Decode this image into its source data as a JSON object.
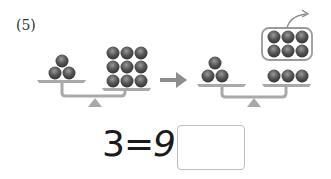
{
  "problem": {
    "number_label": "(5)",
    "equation": {
      "left": "3",
      "operator": "=",
      "right": "9",
      "text": "3=9"
    },
    "answer_box": {
      "value": "",
      "placeholder": ""
    }
  },
  "illustration": {
    "before": {
      "left_pan_balls": 3,
      "right_pan_balls": 9
    },
    "after": {
      "left_pan_balls": 3,
      "right_pan_balls": 3,
      "removed_group_balls": 6
    },
    "colors": {
      "ball": "#4a4a4a",
      "ball_highlight": "#9a9a9a",
      "scale": "#a9a9a9",
      "arrow": "#8c8c8c"
    }
  }
}
